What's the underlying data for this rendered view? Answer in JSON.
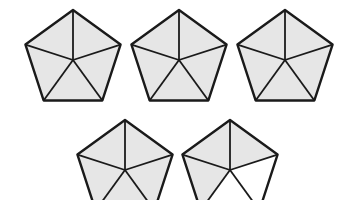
{
  "figure": {
    "colors": {
      "shaded": "#e6e6e6",
      "unshaded": "#ffffff",
      "stroke": "#1a1a1a"
    },
    "pentagons": [
      {
        "id": 1,
        "cx": 73,
        "cy": 60,
        "r": 50,
        "shaded": [
          true,
          true,
          true,
          true,
          true
        ]
      },
      {
        "id": 2,
        "cx": 179,
        "cy": 60,
        "r": 50,
        "shaded": [
          true,
          true,
          true,
          true,
          true
        ]
      },
      {
        "id": 3,
        "cx": 285,
        "cy": 60,
        "r": 50,
        "shaded": [
          true,
          true,
          true,
          true,
          true
        ]
      },
      {
        "id": 4,
        "cx": 125,
        "cy": 170,
        "r": 50,
        "shaded": [
          true,
          true,
          true,
          true,
          true
        ]
      },
      {
        "id": 5,
        "cx": 230,
        "cy": 170,
        "r": 50,
        "shaded": [
          true,
          true,
          false,
          false,
          true
        ]
      }
    ]
  }
}
